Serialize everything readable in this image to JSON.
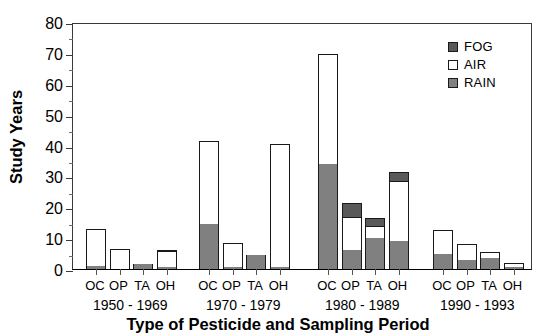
{
  "chart_data": {
    "type": "bar",
    "subtype": "stacked-grouped",
    "title": "",
    "xlabel": "Type of Pesticide and Sampling Period",
    "ylabel": "Study Years",
    "ylim": [
      0,
      80
    ],
    "ytick_step": 10,
    "yminor_step": 5,
    "grid": false,
    "legend_position": "top-right",
    "categories": [
      "OC",
      "OP",
      "TA",
      "OH"
    ],
    "groups": [
      "1950 - 1969",
      "1970 - 1979",
      "1980 - 1989",
      "1990 - 1993"
    ],
    "series": [
      {
        "name": "RAIN",
        "color": "#808080",
        "values": [
          [
            1.0,
            0.0,
            1.5,
            0.5
          ],
          [
            14.5,
            0.5,
            4.5,
            0.5
          ],
          [
            34.0,
            6.0,
            10.0,
            9.0
          ],
          [
            5.0,
            3.0,
            3.5,
            0.5
          ]
        ]
      },
      {
        "name": "AIR",
        "color": "#ffffff",
        "values": [
          [
            12.0,
            6.5,
            0.0,
            5.5
          ],
          [
            27.0,
            8.0,
            0.0,
            40.0
          ],
          [
            35.5,
            11.0,
            4.0,
            19.5
          ],
          [
            7.5,
            5.0,
            2.0,
            1.5
          ]
        ]
      },
      {
        "name": "FOG",
        "color": "#595959",
        "values": [
          [
            0.0,
            0.0,
            0.0,
            0.0
          ],
          [
            0.0,
            0.0,
            0.0,
            0.0
          ],
          [
            0.0,
            4.5,
            2.5,
            3.0
          ],
          [
            0.0,
            0.0,
            0.0,
            0.0
          ]
        ]
      }
    ],
    "totals": [
      [
        13.0,
        6.5,
        1.5,
        6.0
      ],
      [
        41.5,
        8.5,
        4.5,
        40.5
      ],
      [
        69.5,
        21.5,
        16.5,
        31.5
      ],
      [
        12.5,
        8.0,
        5.5,
        2.0
      ]
    ],
    "ytick_labels": [
      "80",
      "70",
      "60",
      "50",
      "40",
      "30",
      "20",
      "10",
      "0"
    ]
  },
  "legend": {
    "items": [
      {
        "label": "FOG",
        "color": "#595959"
      },
      {
        "label": "AIR",
        "color": "#ffffff"
      },
      {
        "label": "RAIN",
        "color": "#808080"
      }
    ]
  }
}
